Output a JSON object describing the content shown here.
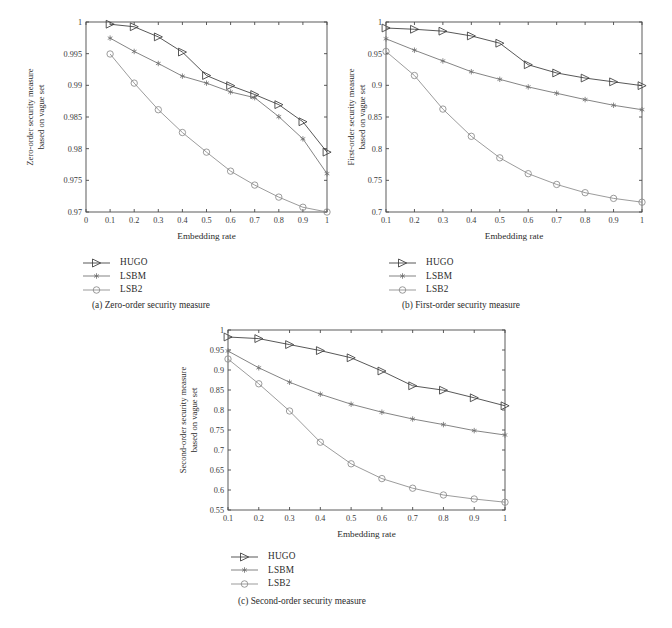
{
  "figure": {
    "panels": [
      {
        "id": "a",
        "caption": "(a)  Zero-order security measure",
        "xlabel": "Embedding rate",
        "ylabel_line1": "Zero-order security measure",
        "ylabel_line2": "based on vague set"
      },
      {
        "id": "b",
        "caption": "(b)  First-order security measure",
        "xlabel": "Embedding rate",
        "ylabel_line1": "First-order security measure",
        "ylabel_line2": "based on vague set"
      },
      {
        "id": "c",
        "caption": "(c)  Second-order security measure",
        "xlabel": "Embedding rate",
        "ylabel_line1": "Second-order security measure",
        "ylabel_line2": "based on vague set"
      }
    ],
    "legend": {
      "entries": [
        {
          "label": "HUGO",
          "marker": "triangle-right-icon",
          "color": "#3a3a3a"
        },
        {
          "label": "LSBM",
          "marker": "asterisk-icon",
          "color": "#6e6e6e"
        },
        {
          "label": "LSB2",
          "marker": "circle-icon",
          "color": "#8a8a8a"
        }
      ]
    }
  },
  "chart_data": [
    {
      "type": "line",
      "id": "a",
      "title": "(a)  Zero-order security measure",
      "xlabel": "Embedding rate",
      "ylabel": "Zero-order security measure based on vague set",
      "x": [
        0.1,
        0.2,
        0.3,
        0.4,
        0.5,
        0.6,
        0.7,
        0.8,
        0.9,
        1.0
      ],
      "xlim": [
        0,
        1
      ],
      "ylim": [
        0.97,
        1
      ],
      "xticks": [
        0,
        0.1,
        0.2,
        0.3,
        0.4,
        0.5,
        0.6,
        0.7,
        0.8,
        0.9,
        1
      ],
      "xticklabels": [
        "0",
        "0.1",
        "0.2",
        "0.3",
        "0.4",
        "0.5",
        "0.6",
        "0.7",
        "0.8",
        "0.9",
        "1"
      ],
      "yticks": [
        0.97,
        0.975,
        0.98,
        0.985,
        0.99,
        0.995,
        1
      ],
      "yticklabels": [
        "0.97",
        "0.975",
        "0.98",
        "0.985",
        "0.99",
        "0.995",
        "1"
      ],
      "grid": false,
      "legend_position": "below-left",
      "series": [
        {
          "name": "HUGO",
          "values": [
            0.99965,
            0.99925,
            0.99765,
            0.99525,
            0.99155,
            0.98995,
            0.98855,
            0.98695,
            0.98425,
            0.97945
          ]
        },
        {
          "name": "LSBM",
          "values": [
            0.99745,
            0.99535,
            0.99345,
            0.99145,
            0.99035,
            0.98895,
            0.98805,
            0.98505,
            0.98155,
            0.97605
          ]
        },
        {
          "name": "LSB2",
          "values": [
            0.99495,
            0.99035,
            0.98615,
            0.98255,
            0.97945,
            0.97645,
            0.97425,
            0.97235,
            0.97075,
            0.97
          ]
        }
      ]
    },
    {
      "type": "line",
      "id": "b",
      "title": "(b)  First-order security measure",
      "xlabel": "Embedding rate",
      "ylabel": "First-order security measure based on vague set",
      "x": [
        0.1,
        0.2,
        0.3,
        0.4,
        0.5,
        0.6,
        0.7,
        0.8,
        0.9,
        1.0
      ],
      "xlim": [
        0.1,
        1
      ],
      "ylim": [
        0.7,
        1
      ],
      "xticks": [
        0.1,
        0.2,
        0.3,
        0.4,
        0.5,
        0.6,
        0.7,
        0.8,
        0.9,
        1
      ],
      "xticklabels": [
        "0.1",
        "0.2",
        "0.3",
        "0.4",
        "0.5",
        "0.6",
        "0.7",
        "0.8",
        "0.9",
        "1"
      ],
      "yticks": [
        0.7,
        0.75,
        0.8,
        0.85,
        0.9,
        0.95,
        1
      ],
      "yticklabels": [
        "0.7",
        "0.75",
        "0.8",
        "0.85",
        "0.9",
        "0.95",
        "1"
      ],
      "grid": false,
      "legend_position": "below-left",
      "series": [
        {
          "name": "HUGO",
          "values": [
            0.9905,
            0.9885,
            0.9855,
            0.978,
            0.9665,
            0.9325,
            0.9195,
            0.9115,
            0.9055,
            0.8995
          ]
        },
        {
          "name": "LSBM",
          "values": [
            0.9735,
            0.9555,
            0.9385,
            0.9215,
            0.9095,
            0.8975,
            0.8875,
            0.8775,
            0.8685,
            0.8615
          ]
        },
        {
          "name": "LSB2",
          "values": [
            0.9535,
            0.9155,
            0.8625,
            0.8195,
            0.7855,
            0.7605,
            0.7435,
            0.7305,
            0.7215,
            0.7155
          ]
        }
      ]
    },
    {
      "type": "line",
      "id": "c",
      "title": "(c)  Second-order security measure",
      "xlabel": "Embedding rate",
      "ylabel": "Second-order security measure based on vague set",
      "x": [
        0.1,
        0.2,
        0.3,
        0.4,
        0.5,
        0.6,
        0.7,
        0.8,
        0.9,
        1.0
      ],
      "xlim": [
        0.1,
        1
      ],
      "ylim": [
        0.55,
        1
      ],
      "xticks": [
        0.1,
        0.2,
        0.3,
        0.4,
        0.5,
        0.6,
        0.7,
        0.8,
        0.9,
        1
      ],
      "xticklabels": [
        "0.1",
        "0.2",
        "0.3",
        "0.4",
        "0.5",
        "0.6",
        "0.7",
        "0.8",
        "0.9",
        "1"
      ],
      "yticks": [
        0.55,
        0.6,
        0.65,
        0.7,
        0.75,
        0.8,
        0.85,
        0.9,
        0.95,
        1
      ],
      "yticklabels": [
        "0.55",
        "0.6",
        "0.65",
        "0.7",
        "0.75",
        "0.8",
        "0.85",
        "0.9",
        "0.95",
        "1"
      ],
      "grid": false,
      "legend_position": "below-left",
      "series": [
        {
          "name": "HUGO",
          "values": [
            0.9825,
            0.9785,
            0.9635,
            0.9485,
            0.9305,
            0.8975,
            0.8605,
            0.8495,
            0.8305,
            0.8105
          ]
        },
        {
          "name": "LSBM",
          "values": [
            0.9475,
            0.9055,
            0.8695,
            0.8395,
            0.8145,
            0.7945,
            0.7775,
            0.7635,
            0.7485,
            0.7375
          ]
        },
        {
          "name": "LSB2",
          "values": [
            0.9275,
            0.8655,
            0.7975,
            0.7195,
            0.6655,
            0.6285,
            0.6045,
            0.5875,
            0.5775,
            0.5695
          ]
        }
      ]
    }
  ]
}
